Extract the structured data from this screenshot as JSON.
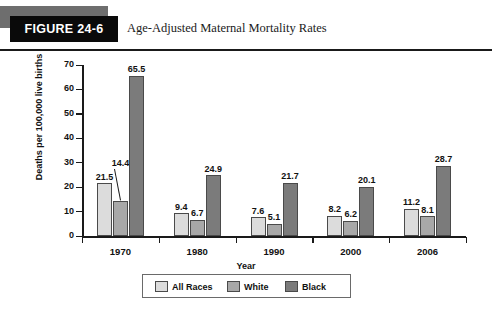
{
  "header": {
    "figure_number": "FIGURE 24-6",
    "title": "Age-Adjusted Maternal Mortality Rates"
  },
  "chart_data": {
    "type": "bar",
    "title": "Age-Adjusted Maternal Mortality Rates",
    "xlabel": "Year",
    "ylabel": "Deaths per 100,000 live births",
    "ylim": [
      0,
      70
    ],
    "yticks": [
      0,
      10,
      20,
      30,
      40,
      50,
      60,
      70
    ],
    "grid": false,
    "legend_position": "bottom",
    "categories": [
      "1970",
      "1980",
      "1990",
      "2000",
      "2006"
    ],
    "series": [
      {
        "name": "All Races",
        "color": "#dcdcdc",
        "values": [
          21.5,
          9.4,
          7.6,
          8.2,
          11.2
        ]
      },
      {
        "name": "White",
        "color": "#a8a8a8",
        "values": [
          14.4,
          6.7,
          5.1,
          6.2,
          8.1
        ]
      },
      {
        "name": "Black",
        "color": "#7b7b7b",
        "values": [
          65.5,
          24.9,
          21.7,
          20.1,
          28.7
        ]
      }
    ],
    "annotations": [
      {
        "text": "14.4",
        "note": "label offset above with leader line to the 1970 White bar"
      }
    ]
  },
  "legend": {
    "items": [
      {
        "label": "All Races",
        "color": "#dcdcdc"
      },
      {
        "label": "White",
        "color": "#a8a8a8"
      },
      {
        "label": "Black",
        "color": "#7b7b7b"
      }
    ]
  }
}
